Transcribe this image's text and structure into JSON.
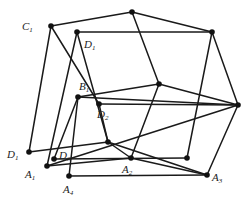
{
  "labels": [
    {
      "id": "C1",
      "text": "C",
      "sub": "1"
    },
    {
      "id": "D1a",
      "text": "D",
      "sub": "1"
    },
    {
      "id": "B1",
      "text": "B",
      "sub": "1"
    },
    {
      "id": "D2",
      "text": "D",
      "sub": "2"
    },
    {
      "id": "D1b",
      "text": "D",
      "sub": "1"
    },
    {
      "id": "D3",
      "text": "D",
      "sub": "3"
    },
    {
      "id": "A1",
      "text": "A",
      "sub": "1"
    },
    {
      "id": "A2",
      "text": "A",
      "sub": "2"
    },
    {
      "id": "A3",
      "text": "A",
      "sub": "3"
    },
    {
      "id": "A4",
      "text": "A",
      "sub": "4"
    }
  ]
}
